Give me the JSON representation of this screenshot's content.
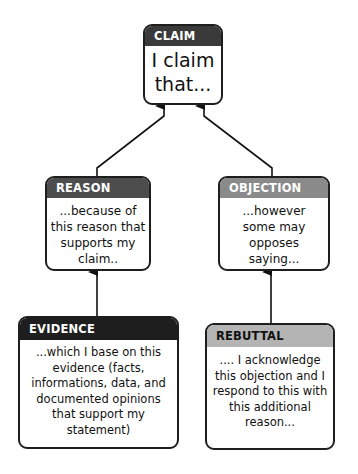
{
  "diagram": {
    "type": "argument-map",
    "nodes": [
      {
        "id": "claim",
        "label": "CLAIM",
        "text": "I claim that...",
        "header_color": "#3a3a3a",
        "header_text_color": "#ffffff"
      },
      {
        "id": "reason",
        "label": "REASON",
        "text": "...because of this reason that supports my claim..",
        "header_color": "#4d4d4d",
        "header_text_color": "#ffffff"
      },
      {
        "id": "objection",
        "label": "OBJECTION",
        "text": "...however some may opposes saying...",
        "header_color": "#8a8a8a",
        "header_text_color": "#ffffff"
      },
      {
        "id": "evidence",
        "label": "EVIDENCE",
        "text": "...which I base on this evidence (facts, informations, data, and documented opinions that support my statement)",
        "header_color": "#1e1e1e",
        "header_text_color": "#ffffff"
      },
      {
        "id": "rebuttal",
        "label": "REBUTTAL",
        "text": ".... I acknowledge this objection and I respond to this with this additional reason...",
        "header_color": "#b4b4b4",
        "header_text_color": "#111111"
      }
    ],
    "edges": [
      {
        "from": "reason",
        "to": "claim"
      },
      {
        "from": "objection",
        "to": "claim"
      },
      {
        "from": "evidence",
        "to": "reason"
      },
      {
        "from": "rebuttal",
        "to": "objection"
      }
    ]
  }
}
